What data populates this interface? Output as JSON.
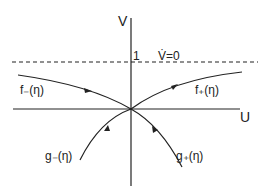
{
  "diagram": {
    "axes": {
      "x_label": "U",
      "y_label": "V"
    },
    "dashed_line": {
      "value_label": "1",
      "annotation": "V̇=0"
    },
    "curves": {
      "f_minus": "f₋(η)",
      "f_plus": "f₊(η)",
      "g_minus": "g₋(η)",
      "g_plus": "g₊(η)"
    },
    "colors": {
      "ink": "#222222",
      "background": "#ffffff"
    }
  }
}
